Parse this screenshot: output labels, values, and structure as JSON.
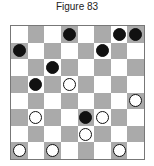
{
  "title": "Figure 83",
  "board": {
    "size": 8,
    "colors": {
      "dark": "#aaaaaa",
      "light": "#ffffff",
      "black_piece": "#111111",
      "white_piece": "#ffffff"
    },
    "pieces": [
      {
        "row": 0,
        "col": 3,
        "color": "black"
      },
      {
        "row": 0,
        "col": 6,
        "color": "black"
      },
      {
        "row": 0,
        "col": 7,
        "color": "black"
      },
      {
        "row": 1,
        "col": 0,
        "color": "black"
      },
      {
        "row": 1,
        "col": 5,
        "color": "black"
      },
      {
        "row": 2,
        "col": 2,
        "color": "black"
      },
      {
        "row": 3,
        "col": 1,
        "color": "black"
      },
      {
        "row": 3,
        "col": 3,
        "color": "white"
      },
      {
        "row": 4,
        "col": 7,
        "color": "white"
      },
      {
        "row": 5,
        "col": 1,
        "color": "white"
      },
      {
        "row": 5,
        "col": 4,
        "color": "black"
      },
      {
        "row": 5,
        "col": 5,
        "color": "white"
      },
      {
        "row": 6,
        "col": 4,
        "color": "white"
      },
      {
        "row": 7,
        "col": 0,
        "color": "white"
      },
      {
        "row": 7,
        "col": 2,
        "color": "white"
      },
      {
        "row": 7,
        "col": 6,
        "color": "white"
      }
    ]
  }
}
